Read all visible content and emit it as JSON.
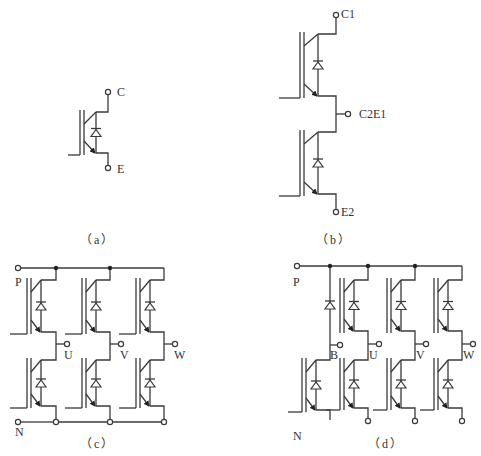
{
  "figure": {
    "stroke_color": "#3a3a3a",
    "background": "#ffffff",
    "panels": [
      {
        "id": "a",
        "caption": "（a）",
        "description": "single IGBT with anti-parallel diode",
        "terminals": [
          {
            "label": "C",
            "x": 117,
            "y": 86
          },
          {
            "label": "E",
            "x": 117,
            "y": 163
          }
        ]
      },
      {
        "id": "b",
        "caption": "（b）",
        "description": "two IGBTs in series (half-bridge)",
        "terminals": [
          {
            "label": "C1",
            "x": 341,
            "y": 8
          },
          {
            "label": "C2E1",
            "x": 359,
            "y": 108
          },
          {
            "label": "E2",
            "x": 341,
            "y": 206
          }
        ]
      },
      {
        "id": "c",
        "caption": "（c）",
        "description": "six IGBTs three-phase bridge",
        "terminals": [
          {
            "label": "P",
            "x": 15,
            "y": 276
          },
          {
            "label": "U",
            "x": 64,
            "y": 349
          },
          {
            "label": "V",
            "x": 120,
            "y": 349
          },
          {
            "label": "W",
            "x": 174,
            "y": 349
          },
          {
            "label": "N",
            "x": 15,
            "y": 426
          }
        ]
      },
      {
        "id": "d",
        "caption": "（d）",
        "description": "seven IGBTs three-phase bridge with brake unit",
        "terminals": [
          {
            "label": "P",
            "x": 293,
            "y": 276
          },
          {
            "label": "B",
            "x": 330,
            "y": 349
          },
          {
            "label": "U",
            "x": 369,
            "y": 349
          },
          {
            "label": "V",
            "x": 416,
            "y": 349
          },
          {
            "label": "W",
            "x": 463,
            "y": 349
          },
          {
            "label": "N",
            "x": 293,
            "y": 430
          }
        ]
      }
    ],
    "captions_pos": [
      {
        "x": 84,
        "y": 234
      },
      {
        "x": 322,
        "y": 234
      },
      {
        "x": 84,
        "y": 438
      },
      {
        "x": 371,
        "y": 438
      }
    ]
  }
}
